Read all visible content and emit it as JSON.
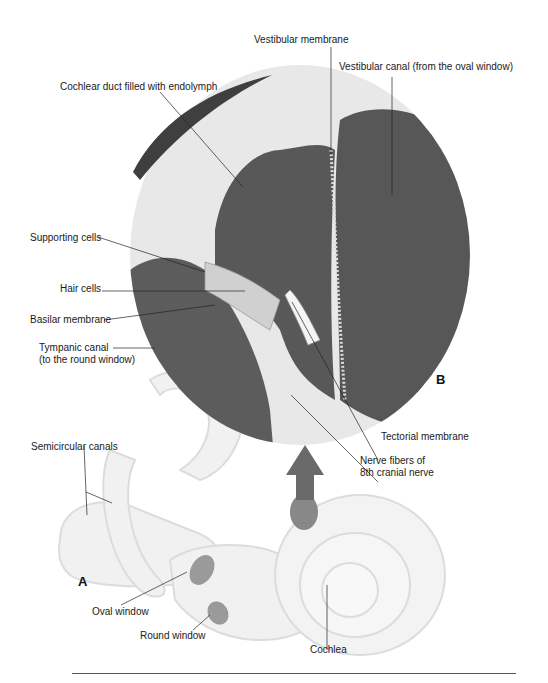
{
  "figure": {
    "panels": [
      {
        "id": "A",
        "label": "A",
        "description": "Inner ear (labyrinth)"
      },
      {
        "id": "B",
        "label": "B",
        "description": "Cross-section of cochlea"
      }
    ],
    "labels": {
      "vestibular_membrane": "Vestibular membrane",
      "vestibular_canal": "Vestibular canal (from the oval window)",
      "cochlear_duct": "Cochlear duct filled with endolymph",
      "supporting_cells": "Supporting cells",
      "hair_cells": "Hair cells",
      "basilar_membrane": "Basilar membrane",
      "tympanic_canal_1": "Tympanic canal",
      "tympanic_canal_2": "(to the round window)",
      "tectorial_membrane": "Tectorial membrane",
      "nerve_fibers_1": "Nerve fibers of",
      "nerve_fibers_2": "8th cranial nerve",
      "semicircular_canals": "Semicircular canals",
      "oval_window": "Oval window",
      "round_window": "Round window",
      "cochlea": "Cochlea"
    },
    "colors": {
      "fluid": "#5a5a5a",
      "tissue": "#e6e6e6",
      "labyrinth": "#f0f0f0",
      "line": "#222222"
    }
  }
}
